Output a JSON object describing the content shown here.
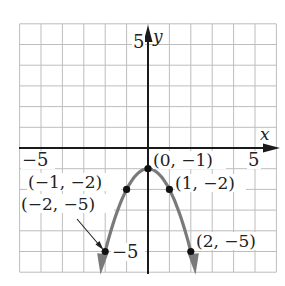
{
  "chart_data": {
    "type": "line",
    "title": "",
    "xlabel": "x",
    "ylabel": "y",
    "xlim": [
      -6,
      6
    ],
    "ylim": [
      -6,
      6
    ],
    "grid": true,
    "x_tick_labels": [
      {
        "value": -5,
        "label": "−5"
      },
      {
        "value": 5,
        "label": "5"
      }
    ],
    "y_tick_labels": [
      {
        "value": 5,
        "label": "5"
      },
      {
        "value": -5,
        "label": "−5"
      }
    ],
    "series": [
      {
        "name": "parabola",
        "equation": "y = -x^2 - 1",
        "color": "#7a7a7a",
        "points": [
          {
            "x": -2,
            "y": -5,
            "label": "(−2, −5)"
          },
          {
            "x": -1,
            "y": -2,
            "label": "(−1, −2)"
          },
          {
            "x": 0,
            "y": -1,
            "label": "(0, −1)"
          },
          {
            "x": 1,
            "y": -2,
            "label": "(1, −2)"
          },
          {
            "x": 2,
            "y": -5,
            "label": "(2, −5)"
          }
        ]
      }
    ],
    "annotations": [
      {
        "text": "(−2, −5)",
        "arrow_to": {
          "x": -2,
          "y": -5
        }
      }
    ],
    "legend": null
  },
  "labels": {
    "x_axis": "x",
    "y_axis": "y",
    "x_neg5": "−5",
    "x_pos5": "5",
    "y_pos5": "5",
    "y_neg5": "−5",
    "pt_vertex": "(0, −1)",
    "pt_m1": "(−1, −2)",
    "pt_p1": "(1, −2)",
    "pt_m2": "(−2, −5)",
    "pt_p2": "(2, −5)"
  },
  "colors": {
    "grid": "#bdbdbd",
    "axis": "#1a1a1a",
    "curve": "#7a7a7a",
    "point": "#111111"
  }
}
